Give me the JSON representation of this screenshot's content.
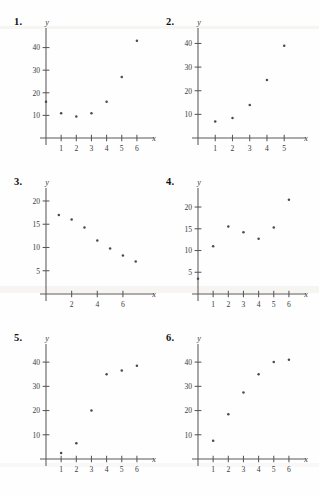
{
  "page": {
    "background": "#fefefe",
    "ink": "#3a3a3a",
    "point_color": "#4a4a4a"
  },
  "problems": [
    {
      "number": "1."
    },
    {
      "number": "2."
    },
    {
      "number": "3."
    },
    {
      "number": "4."
    },
    {
      "number": "5."
    },
    {
      "number": "6."
    }
  ],
  "chart_data": [
    {
      "id": "plot-1",
      "type": "scatter",
      "title": "1.",
      "xlabel": "x",
      "ylabel": "y",
      "xlim": [
        0,
        6.6
      ],
      "ylim": [
        0,
        46
      ],
      "xticks": [
        1,
        2,
        3,
        4,
        5,
        6
      ],
      "yticks": [
        10,
        20,
        30,
        40
      ],
      "grid": false,
      "legend": "none",
      "x": [
        0,
        1,
        2,
        3,
        4,
        5,
        6
      ],
      "y": [
        16,
        11,
        9.5,
        11,
        16,
        27,
        43
      ]
    },
    {
      "id": "plot-2",
      "type": "scatter",
      "title": "2.",
      "xlabel": "x",
      "ylabel": "y",
      "xlim": [
        0,
        5.8
      ],
      "ylim": [
        0,
        44
      ],
      "xticks": [
        1,
        2,
        3,
        4,
        5
      ],
      "yticks": [
        10,
        20,
        30,
        40
      ],
      "grid": false,
      "legend": "none",
      "x": [
        1,
        2,
        3,
        4,
        5
      ],
      "y": [
        7,
        8.5,
        14,
        24.5,
        39
      ]
    },
    {
      "id": "plot-3",
      "type": "scatter",
      "title": "3.",
      "xlabel": "x",
      "ylabel": "y",
      "xlim": [
        0,
        7.8
      ],
      "ylim": [
        0,
        21.5
      ],
      "xticks": [
        2,
        4,
        6
      ],
      "yticks": [
        5,
        10,
        15,
        20
      ],
      "grid": false,
      "legend": "none",
      "x": [
        1,
        2,
        3,
        4,
        5,
        6,
        7
      ],
      "y": [
        17,
        16,
        14.3,
        11.5,
        9.8,
        8.3,
        7
      ]
    },
    {
      "id": "plot-4",
      "type": "scatter",
      "title": "4.",
      "xlabel": "x",
      "ylabel": "y",
      "xlim": [
        0,
        6.6
      ],
      "ylim": [
        0,
        23
      ],
      "xticks": [
        1,
        2,
        3,
        4,
        5,
        6
      ],
      "yticks": [
        5,
        10,
        15,
        20
      ],
      "grid": false,
      "legend": "none",
      "x": [
        0,
        1,
        2,
        3,
        4,
        5,
        6
      ],
      "y": [
        3.5,
        11,
        15.5,
        14.2,
        12.7,
        15.3,
        21.7
      ]
    },
    {
      "id": "plot-5",
      "type": "scatter",
      "title": "5.",
      "xlabel": "x",
      "ylabel": "y",
      "xlim": [
        0,
        6.6
      ],
      "ylim": [
        0,
        45
      ],
      "xticks": [
        1,
        2,
        3,
        4,
        5,
        6
      ],
      "yticks": [
        10,
        20,
        30,
        40
      ],
      "grid": false,
      "legend": "none",
      "x": [
        1,
        2,
        3,
        4,
        5,
        6
      ],
      "y": [
        2.5,
        6.5,
        20,
        35,
        36.5,
        38.5
      ]
    },
    {
      "id": "plot-6",
      "type": "scatter",
      "title": "6.",
      "xlabel": "x",
      "ylabel": "y",
      "xlim": [
        0,
        6.6
      ],
      "ylim": [
        0,
        45
      ],
      "xticks": [
        1,
        2,
        3,
        4,
        5,
        6
      ],
      "yticks": [
        10,
        20,
        30,
        40
      ],
      "grid": false,
      "legend": "none",
      "x": [
        1,
        2,
        3,
        4,
        5,
        6
      ],
      "y": [
        7.5,
        18.5,
        27.5,
        35,
        40,
        41
      ]
    }
  ]
}
